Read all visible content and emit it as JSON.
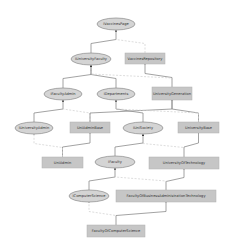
{
  "diagram": {
    "type": "class-hierarchy",
    "note": "Labels are approximate — rendered text is too small/blurred to read exactly.",
    "colors": {
      "ellipse_fill": "#d4d4d4",
      "ellipse_stroke": "#8a8a8a",
      "rect_fill": "#c6c6c6",
      "rect_stroke": "#b0b0b0",
      "edge_solid": "#8c8c8c",
      "edge_dashed": "#cfcfcf"
    },
    "nodes": [
      {
        "id": "n1",
        "shape": "ellipse",
        "label": "IVaccinesPage",
        "cx": 116,
        "cy": 24,
        "rx": 19,
        "ry": 6
      },
      {
        "id": "n2",
        "shape": "rect",
        "label": "VaccinesRepository",
        "x": 125,
        "y": 53,
        "w": 40,
        "h": 11
      },
      {
        "id": "n3",
        "shape": "ellipse",
        "label": "IUniversityFaculty",
        "cx": 91,
        "cy": 59,
        "rx": 20,
        "ry": 6
      },
      {
        "id": "n4",
        "shape": "ellipse",
        "label": "IFacultyAdmin",
        "cx": 63,
        "cy": 94,
        "rx": 19,
        "ry": 6
      },
      {
        "id": "n5",
        "shape": "ellipse",
        "label": "IDepartments",
        "cx": 116,
        "cy": 94,
        "rx": 19,
        "ry": 6
      },
      {
        "id": "n6",
        "shape": "rect",
        "label": "UniversityGeneration",
        "x": 152,
        "y": 87,
        "w": 40,
        "h": 13
      },
      {
        "id": "n7",
        "shape": "ellipse",
        "label": "IUniversityAdmin",
        "cx": 34,
        "cy": 128,
        "rx": 19,
        "ry": 6
      },
      {
        "id": "n8",
        "shape": "rect",
        "label": "UniAdminBase",
        "x": 70,
        "y": 122,
        "w": 40,
        "h": 11
      },
      {
        "id": "n9",
        "shape": "ellipse",
        "label": "IUniSociety",
        "cx": 143,
        "cy": 128,
        "rx": 20,
        "ry": 6
      },
      {
        "id": "n10",
        "shape": "rect",
        "label": "UniversityBase",
        "x": 178,
        "y": 122,
        "w": 41,
        "h": 11
      },
      {
        "id": "n11",
        "shape": "rect",
        "label": "UniAdmin",
        "x": 42,
        "y": 157,
        "w": 41,
        "h": 11
      },
      {
        "id": "n12",
        "shape": "ellipse",
        "label": "IFaculty",
        "cx": 115,
        "cy": 162,
        "rx": 20,
        "ry": 6
      },
      {
        "id": "n13",
        "shape": "rect",
        "label": "UniversityOfTechnology",
        "x": 149,
        "y": 157,
        "w": 70,
        "h": 12
      },
      {
        "id": "n14",
        "shape": "ellipse",
        "label": "IComputerScience",
        "cx": 89,
        "cy": 196,
        "rx": 20,
        "ry": 6
      },
      {
        "id": "n15",
        "shape": "rect",
        "label": "FacultyOfBusinessAdministrationTechnology",
        "x": 116,
        "y": 190,
        "w": 100,
        "h": 12
      },
      {
        "id": "n16",
        "shape": "rect",
        "label": "FacultyOfComputerScience",
        "x": 87,
        "y": 225,
        "w": 58,
        "h": 12
      }
    ],
    "edges": [
      {
        "from": "n3",
        "to": "n1",
        "style": "solid",
        "arrow": true
      },
      {
        "from": "n2",
        "to": "n1",
        "style": "dashed"
      },
      {
        "from": "n4",
        "to": "n3",
        "style": "solid",
        "arrow": true
      },
      {
        "from": "n5",
        "to": "n3",
        "style": "solid",
        "arrow": true
      },
      {
        "from": "n6",
        "to": "n2",
        "style": "solid"
      },
      {
        "from": "n6",
        "to": "n3",
        "style": "dashed"
      },
      {
        "from": "n7",
        "to": "n4",
        "style": "solid",
        "arrow": true
      },
      {
        "from": "n8",
        "to": "n4",
        "style": "dashed"
      },
      {
        "from": "n9",
        "to": "n5",
        "style": "solid",
        "arrow": true
      },
      {
        "from": "n8",
        "to": "n6",
        "style": "solid"
      },
      {
        "from": "n10",
        "to": "n6",
        "style": "solid"
      },
      {
        "from": "n10",
        "to": "n5",
        "style": "dashed"
      },
      {
        "from": "n11",
        "to": "n8",
        "style": "solid"
      },
      {
        "from": "n11",
        "to": "n7",
        "style": "dashed"
      },
      {
        "from": "n12",
        "to": "n9",
        "style": "solid",
        "arrow": true
      },
      {
        "from": "n13",
        "to": "n10",
        "style": "solid"
      },
      {
        "from": "n13",
        "to": "n9",
        "style": "dashed"
      },
      {
        "from": "n14",
        "to": "n12",
        "style": "solid",
        "arrow": true
      },
      {
        "from": "n15",
        "to": "n13",
        "style": "solid"
      },
      {
        "from": "n15",
        "to": "n12",
        "style": "dashed"
      },
      {
        "from": "n16",
        "to": "n15",
        "style": "solid"
      },
      {
        "from": "n16",
        "to": "n14",
        "style": "dashed"
      }
    ]
  }
}
